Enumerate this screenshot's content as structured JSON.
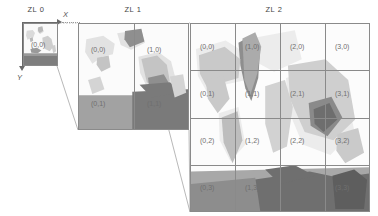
{
  "figure": {
    "background_color": "#ffffff",
    "grid_line_color": "#8a8a8a",
    "label_color": "#6f6f6f",
    "axis_color": "#6a6a6a"
  },
  "axes": {
    "x_label": "X",
    "y_label": "Y"
  },
  "panels": [
    {
      "id": "zl0",
      "title": "ZL 0",
      "zoom_level": 0,
      "cols": 1,
      "rows": 1,
      "tiles": [
        {
          "label": "(0,0)",
          "col": 0,
          "row": 0
        }
      ]
    },
    {
      "id": "zl1",
      "title": "ZL 1",
      "zoom_level": 1,
      "cols": 2,
      "rows": 2,
      "tiles": [
        {
          "label": "(0,0)",
          "col": 0,
          "row": 0
        },
        {
          "label": "(1,0)",
          "col": 1,
          "row": 0
        },
        {
          "label": "(0,1)",
          "col": 0,
          "row": 1
        },
        {
          "label": "(1,1)",
          "col": 1,
          "row": 1
        }
      ]
    },
    {
      "id": "zl2",
      "title": "ZL 2",
      "zoom_level": 2,
      "cols": 4,
      "rows": 4,
      "tiles": [
        {
          "label": "(0,0)",
          "col": 0,
          "row": 0
        },
        {
          "label": "(1,0)",
          "col": 1,
          "row": 0
        },
        {
          "label": "(2,0)",
          "col": 2,
          "row": 0
        },
        {
          "label": "(3,0)",
          "col": 3,
          "row": 0
        },
        {
          "label": "(0,1)",
          "col": 0,
          "row": 1
        },
        {
          "label": "(1,1)",
          "col": 1,
          "row": 1
        },
        {
          "label": "(2,1)",
          "col": 2,
          "row": 1
        },
        {
          "label": "(3,1)",
          "col": 3,
          "row": 1
        },
        {
          "label": "(0,2)",
          "col": 0,
          "row": 2
        },
        {
          "label": "(1,2)",
          "col": 1,
          "row": 2
        },
        {
          "label": "(2,2)",
          "col": 2,
          "row": 2
        },
        {
          "label": "(3,2)",
          "col": 3,
          "row": 2
        },
        {
          "label": "(0,3)",
          "col": 0,
          "row": 3
        },
        {
          "label": "(1,3)",
          "col": 1,
          "row": 3
        },
        {
          "label": "(2,3)",
          "col": 2,
          "row": 3
        },
        {
          "label": "(3,3)",
          "col": 3,
          "row": 3
        }
      ]
    }
  ]
}
